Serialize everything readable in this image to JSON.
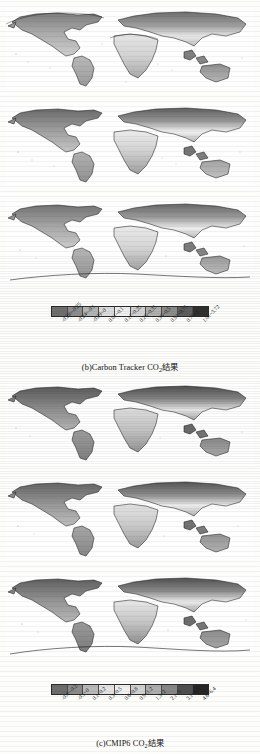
{
  "figure": {
    "groups": [
      {
        "id": "group-b",
        "caption_prefix": "(b)Carbon Tracker CO",
        "caption_sub": "2",
        "caption_suffix": "结果",
        "caption_full": "(b)Carbon Tracker CO2结果",
        "panel_count": 3,
        "colorbar": {
          "type": "grayscale-discrete",
          "segment_count": 10,
          "colors": [
            "#6f6f6f",
            "#8e8e8e",
            "#b4b4b4",
            "#dcdcdc",
            "#efefef",
            "#d2d2d2",
            "#b0b0b0",
            "#8c8c8c",
            "#5e5e5e",
            "#303030"
          ],
          "labels": [
            "-0.28~-0.25",
            "-0.24~-0.1",
            "-0.09~0",
            "0.01~0.1",
            "0.11~0.25",
            "0.26~0.35",
            "0.36~0.5",
            "0.51~0.75",
            "0.76~1",
            "1.01~3.72"
          ]
        }
      },
      {
        "id": "group-c",
        "caption_prefix": "(c)CMIP6 CO",
        "caption_sub": "2",
        "caption_suffix": "结果",
        "caption_full": "(c)CMIP6 CO2结果",
        "panel_count": 3,
        "colorbar": {
          "type": "grayscale-discrete",
          "segment_count": 10,
          "colors": [
            "#6c6c6c",
            "#8b8b8b",
            "#b8b8b8",
            "#e2e2e2",
            "#f0f0f0",
            "#d0d0d0",
            "#aeaeae",
            "#868686",
            "#4f4f4f",
            "#262626"
          ],
          "labels": [
            "-0.4~-0.2",
            "-0.1~0",
            "0.1~0.2",
            "0.3~0.5",
            "0.6~0.8",
            "0.9~1.2",
            "1.3~2",
            "2.1~3",
            "3.1~4.5",
            "4.6~6.4"
          ]
        }
      }
    ],
    "panels": [
      {
        "name": "map-panel-b1",
        "group": "group-b",
        "index": 1
      },
      {
        "name": "map-panel-b2",
        "group": "group-b",
        "index": 2
      },
      {
        "name": "map-panel-b3",
        "group": "group-b",
        "index": 3
      },
      {
        "name": "map-panel-c1",
        "group": "group-c",
        "index": 1
      },
      {
        "name": "map-panel-c2",
        "group": "group-c",
        "index": 2
      },
      {
        "name": "map-panel-c3",
        "group": "group-c",
        "index": 3
      }
    ]
  }
}
